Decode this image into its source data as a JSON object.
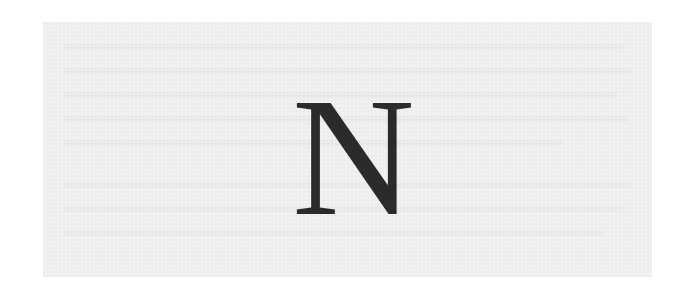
{
  "document": {
    "letter": "N"
  },
  "colors": {
    "page_background": "#ffffff",
    "paper_background": "#eeeeee",
    "letter_color": "#2b2b2b"
  }
}
